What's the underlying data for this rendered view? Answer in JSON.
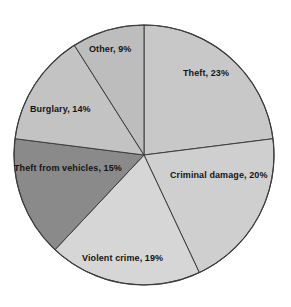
{
  "chart_data": {
    "type": "pie",
    "title": "",
    "subtitle": "",
    "xlabel": "",
    "ylabel": "",
    "grid": false,
    "legend": "none",
    "labels_inline": true,
    "start_angle_deg": 0,
    "direction": "clockwise",
    "units": "percent",
    "total": 100,
    "categories": [
      "Theft",
      "Criminal damage",
      "Violent crime",
      "Theft from vehicles",
      "Burglary",
      "Other"
    ],
    "values": [
      23,
      20,
      19,
      15,
      14,
      9
    ],
    "slices": [
      {
        "name": "Theft",
        "value": 23,
        "label": "Theft, 23%",
        "color": "#c8c8c8"
      },
      {
        "name": "Criminal damage",
        "value": 20,
        "label": "Criminal damage, 20%",
        "color": "#cfcfcf"
      },
      {
        "name": "Violent crime",
        "value": 19,
        "label": "Violent crime, 19%",
        "color": "#d6d6d6"
      },
      {
        "name": "Theft from vehicles",
        "value": 15,
        "label": "Theft from vehicles, 15%",
        "color": "#8a8a8a"
      },
      {
        "name": "Burglary",
        "value": 14,
        "label": "Burglary, 14%",
        "color": "#c3c3c3"
      },
      {
        "name": "Other",
        "value": 9,
        "label": "Other, 9%",
        "color": "#bdbdbd"
      }
    ],
    "style": {
      "outline_color": "#3c3c3c",
      "background": "#ffffff",
      "center_x": 144,
      "center_y": 155,
      "radius": 130
    }
  }
}
